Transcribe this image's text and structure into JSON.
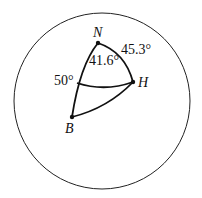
{
  "diagram": {
    "type": "spherical-triangle",
    "points": {
      "N": {
        "label": "N"
      },
      "H": {
        "label": "H"
      },
      "B": {
        "label": "B"
      }
    },
    "angles": {
      "angle_at_N": "41.6°",
      "arc_NH": "45.3°",
      "latitude_left": "50°"
    },
    "colors": {
      "stroke": "#111111",
      "background": "#ffffff"
    }
  }
}
